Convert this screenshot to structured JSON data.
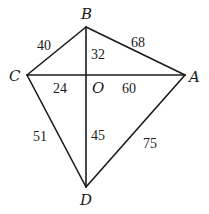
{
  "diagram": {
    "type": "kite-quadrilateral-with-diagonals",
    "vertices": {
      "A": {
        "label": "A",
        "x": 185,
        "y": 75
      },
      "B": {
        "label": "B",
        "x": 86,
        "y": 27
      },
      "C": {
        "label": "C",
        "x": 27,
        "y": 75
      },
      "D": {
        "label": "D",
        "x": 86,
        "y": 187
      },
      "O": {
        "label": "O",
        "x": 86,
        "y": 75
      }
    },
    "edges": [
      {
        "from": "C",
        "to": "B",
        "length": "40"
      },
      {
        "from": "B",
        "to": "A",
        "length": "68"
      },
      {
        "from": "C",
        "to": "D",
        "length": "51"
      },
      {
        "from": "D",
        "to": "A",
        "length": "75"
      },
      {
        "from": "B",
        "to": "O",
        "length": "32"
      },
      {
        "from": "C",
        "to": "O",
        "length": "24"
      },
      {
        "from": "O",
        "to": "A",
        "length": "60"
      },
      {
        "from": "O",
        "to": "D",
        "length": "45"
      }
    ]
  }
}
